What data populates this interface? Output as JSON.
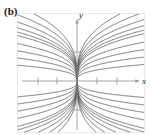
{
  "figure": {
    "panel_label": "(b)",
    "axis_x_label": "x",
    "axis_y_label": "y",
    "frame": {
      "x": 17,
      "y": 13,
      "width": 128,
      "height": 120,
      "border_color": "#e9e9e9"
    },
    "colors": {
      "background": "#ffffff",
      "axis": "#9a9a9a",
      "curve": "#565656",
      "label": "#1b1b1b",
      "frame": "#e9e9e9"
    }
  },
  "chart_data": {
    "type": "line",
    "title": "",
    "subtitle": "",
    "xlabel": "x",
    "ylabel": "y",
    "grid": false,
    "legend": "none",
    "axes": {
      "origin_px": {
        "x": 77,
        "y": 81
      },
      "x_range_px": {
        "min": 22,
        "max": 142
      },
      "y_range_px": {
        "min": 18,
        "max": 132
      },
      "x_ticks_px": [
        38,
        57,
        97,
        117
      ],
      "y_ticks_px": [
        52,
        110
      ],
      "x_tick_labels": [
        "",
        "",
        "",
        ""
      ],
      "y_tick_labels": [
        "",
        ""
      ],
      "x_arrow": true,
      "y_arrow": true,
      "units_per_tick_px": 20
    },
    "family_parameter": "k",
    "series": [
      {
        "name": "k=2.60",
        "k": 2.6,
        "exponent": 0.3333
      },
      {
        "name": "k=2.30",
        "k": 2.3,
        "exponent": 0.3333
      },
      {
        "name": "k=2.05",
        "k": 2.05,
        "exponent": 0.3333
      },
      {
        "name": "k=1.85",
        "k": 1.85,
        "exponent": 0.3333
      },
      {
        "name": "k=1.70",
        "k": 1.7,
        "exponent": 0.3333
      },
      {
        "name": "k=1.58",
        "k": 1.58,
        "exponent": 0.3333
      },
      {
        "name": "k=1.30",
        "k": 1.3,
        "exponent": 0.3333
      },
      {
        "name": "k=1.05",
        "k": 1.05,
        "exponent": 0.3333
      },
      {
        "name": "k=0.80",
        "k": 0.8,
        "exponent": 0.3333
      },
      {
        "name": "k=0.55",
        "k": 0.55,
        "exponent": 0.3333
      },
      {
        "name": "k=-0.55",
        "k": -0.55,
        "exponent": 0.3333
      },
      {
        "name": "k=-0.80",
        "k": -0.8,
        "exponent": 0.3333
      },
      {
        "name": "k=-1.05",
        "k": -1.05,
        "exponent": 0.3333
      },
      {
        "name": "k=-1.30",
        "k": -1.3,
        "exponent": 0.3333
      },
      {
        "name": "k=-1.58",
        "k": -1.58,
        "exponent": 0.3333
      },
      {
        "name": "k=-1.70",
        "k": -1.7,
        "exponent": 0.3333
      },
      {
        "name": "k=-1.85",
        "k": -1.85,
        "exponent": 0.3333
      },
      {
        "name": "k=-2.05",
        "k": -2.05,
        "exponent": 0.3333
      },
      {
        "name": "k=-2.30",
        "k": -2.3,
        "exponent": 0.3333
      },
      {
        "name": "k=-2.60",
        "k": -2.6,
        "exponent": 0.3333
      }
    ]
  }
}
